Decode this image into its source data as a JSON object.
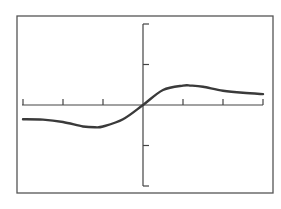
{
  "chart_data": {
    "type": "line",
    "title": "",
    "xlabel": "",
    "ylabel": "",
    "xlim": [
      -3,
      3
    ],
    "ylim": [
      -2,
      2
    ],
    "grid": false,
    "legend": null,
    "x_ticks": [
      -3,
      -2,
      -1,
      1,
      2,
      3
    ],
    "y_ticks": [
      -2,
      -1,
      1,
      2
    ],
    "tick_labels_shown": false,
    "series": [
      {
        "name": "f(x)",
        "x": [
          -3.0,
          -2.5,
          -2.0,
          -1.5,
          -1.2,
          -1.0,
          -0.5,
          0.0,
          0.5,
          1.0,
          1.2,
          1.5,
          2.0,
          2.5,
          3.0
        ],
        "y": [
          -0.35,
          -0.36,
          -0.42,
          -0.53,
          -0.55,
          -0.53,
          -0.35,
          0.0,
          0.37,
          0.48,
          0.48,
          0.45,
          0.35,
          0.3,
          0.27
        ]
      }
    ],
    "style": {
      "frame_color": "#555555",
      "axis_color": "#444444",
      "curve_color": "#3a3a3a",
      "background": "#ffffff"
    }
  }
}
